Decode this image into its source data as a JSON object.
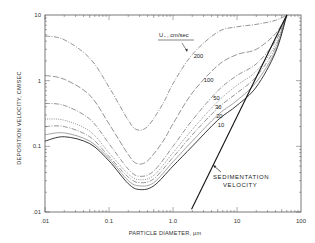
{
  "chart_data": {
    "type": "line",
    "title": "",
    "xlabel": "PARTICLE DIAMETER, μm",
    "ylabel": "DEPOSITION VELOCITY, CM/SEC",
    "xscale": "log",
    "yscale": "log",
    "xlim": [
      0.01,
      100
    ],
    "ylim": [
      0.01,
      10
    ],
    "x_ticks": [
      ".01",
      "0.1",
      "1.0",
      "10",
      "100"
    ],
    "y_ticks": [
      ".01",
      "0.1",
      "1",
      "10"
    ],
    "grid": false,
    "legend_title": "U*, cm/sec",
    "series": [
      {
        "name": "200",
        "style": "dash-dot",
        "x": [
          0.01,
          0.02,
          0.05,
          0.1,
          0.2,
          0.27,
          0.4,
          0.7,
          1.0,
          2.0,
          5.0,
          10,
          20,
          40,
          60
        ],
        "y": [
          4.8,
          4.2,
          2.2,
          0.8,
          0.25,
          0.18,
          0.2,
          0.45,
          0.9,
          2.5,
          5.5,
          6.6,
          7.2,
          8.3,
          10
        ]
      },
      {
        "name": "100",
        "style": "long-dash",
        "x": [
          0.01,
          0.02,
          0.05,
          0.1,
          0.2,
          0.27,
          0.4,
          0.7,
          1.0,
          2.0,
          5.0,
          10,
          20,
          40,
          60
        ],
        "y": [
          1.2,
          1.05,
          0.6,
          0.22,
          0.075,
          0.055,
          0.06,
          0.12,
          0.22,
          0.65,
          1.7,
          2.5,
          3.0,
          5.2,
          10
        ]
      },
      {
        "name": "50",
        "style": "dash-dot",
        "x": [
          0.01,
          0.02,
          0.05,
          0.1,
          0.2,
          0.3,
          0.5,
          1.0,
          2.0,
          5.0,
          10,
          20,
          40,
          60
        ],
        "y": [
          0.45,
          0.42,
          0.26,
          0.11,
          0.045,
          0.035,
          0.042,
          0.1,
          0.25,
          0.7,
          1.2,
          1.8,
          4.0,
          10
        ]
      },
      {
        "name": "30",
        "style": "dotted",
        "x": [
          0.01,
          0.02,
          0.05,
          0.1,
          0.2,
          0.3,
          0.5,
          1.0,
          2.0,
          5.0,
          10,
          20,
          40,
          60
        ],
        "y": [
          0.26,
          0.25,
          0.17,
          0.08,
          0.038,
          0.031,
          0.036,
          0.08,
          0.18,
          0.48,
          0.85,
          1.4,
          3.5,
          10
        ]
      },
      {
        "name": "20",
        "style": "dash-dot",
        "x": [
          0.01,
          0.02,
          0.05,
          0.1,
          0.2,
          0.3,
          0.5,
          1.0,
          2.0,
          5.0,
          10,
          20,
          40,
          60
        ],
        "y": [
          0.2,
          0.2,
          0.14,
          0.07,
          0.034,
          0.028,
          0.032,
          0.068,
          0.15,
          0.38,
          0.65,
          1.15,
          3.2,
          10
        ]
      },
      {
        "name": "10",
        "style": "solid-thin",
        "x": [
          0.01,
          0.02,
          0.05,
          0.1,
          0.2,
          0.3,
          0.5,
          1.0,
          2.0,
          5.0,
          10,
          20,
          40,
          60
        ],
        "y": [
          0.15,
          0.16,
          0.12,
          0.065,
          0.03,
          0.025,
          0.028,
          0.058,
          0.12,
          0.3,
          0.5,
          0.95,
          2.9,
          10
        ]
      },
      {
        "name": "lowest",
        "style": "solid",
        "x": [
          0.01,
          0.02,
          0.05,
          0.1,
          0.2,
          0.3,
          0.5,
          1.0,
          2.0,
          5.0,
          10,
          20,
          40,
          60
        ],
        "y": [
          0.12,
          0.14,
          0.11,
          0.06,
          0.027,
          0.022,
          0.025,
          0.05,
          0.1,
          0.25,
          0.42,
          0.8,
          2.7,
          10
        ]
      },
      {
        "name": "Sedimentation velocity",
        "style": "solid-bold",
        "x": [
          1.95,
          60
        ],
        "y": [
          0.011,
          10
        ]
      }
    ],
    "annotations": [
      {
        "text": "200",
        "x": 2.5,
        "y": 2.2
      },
      {
        "text": "100",
        "x": 3.6,
        "y": 0.95
      },
      {
        "text": "50",
        "x": 4.8,
        "y": 0.5
      },
      {
        "text": "30",
        "x": 5.1,
        "y": 0.37
      },
      {
        "text": "20",
        "x": 5.3,
        "y": 0.27
      },
      {
        "text": "10",
        "x": 5.6,
        "y": 0.2
      },
      {
        "text": "SEDIMENTATION VELOCITY",
        "x": 6,
        "y": 0.045
      }
    ]
  },
  "labels": {
    "legend_title_u": "U",
    "legend_title_sub": "*",
    "legend_title_rest": ", cm/sec",
    "sed_line1": "SEDIMENTATION",
    "sed_line2": "VELOCITY",
    "xlabel": "PARTICLE DIAMETER, μm",
    "ylabel": "DEPOSITION VELOCITY, CM/SEC"
  }
}
